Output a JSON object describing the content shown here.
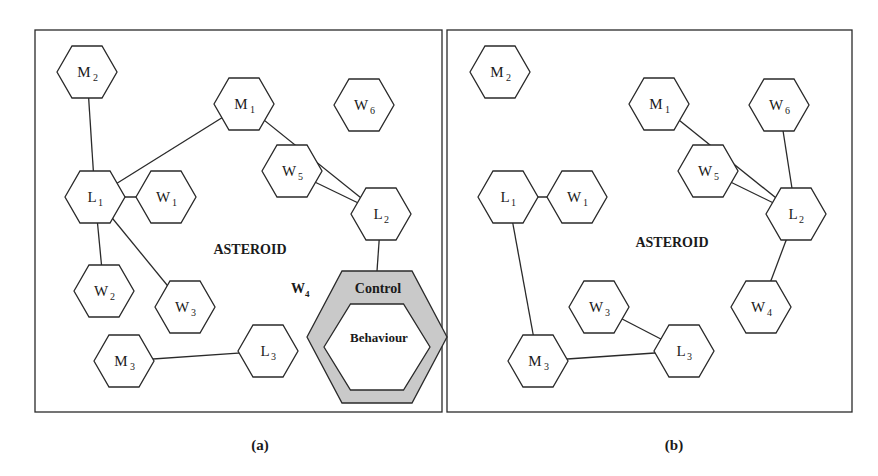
{
  "figure": {
    "panels": [
      {
        "id": "a",
        "caption": "(a)",
        "region_label": "ASTEROID",
        "frame": {
          "x": 35,
          "y": 30,
          "w": 407,
          "h": 163
        },
        "nodes": [
          {
            "id": "M2",
            "letter": "M",
            "sub": "2",
            "cx": 87,
            "cy": 72
          },
          {
            "id": "M1",
            "letter": "M",
            "sub": "1",
            "cx": 244,
            "cy": 104
          },
          {
            "id": "W6",
            "letter": "W",
            "sub": "6",
            "cx": 364,
            "cy": 105
          },
          {
            "id": "W5",
            "letter": "W",
            "sub": "5",
            "cx": 292,
            "cy": 171
          },
          {
            "id": "L1",
            "letter": "L",
            "sub": "1",
            "cx": 95,
            "cy": 197
          },
          {
            "id": "W1",
            "letter": "W",
            "sub": "1",
            "cx": 166,
            "cy": 197
          },
          {
            "id": "L2",
            "letter": "L",
            "sub": "2",
            "cx": 381,
            "cy": 214
          },
          {
            "id": "W2",
            "letter": "W",
            "sub": "2",
            "cx": 104,
            "cy": 291
          },
          {
            "id": "W3",
            "letter": "W",
            "sub": "3",
            "cx": 185,
            "cy": 307
          },
          {
            "id": "M3",
            "letter": "M",
            "sub": "3",
            "cx": 124,
            "cy": 361
          },
          {
            "id": "L3",
            "letter": "L",
            "sub": "3",
            "cx": 268,
            "cy": 351
          }
        ],
        "links": [
          [
            "M2",
            "L1"
          ],
          [
            "L1",
            "M1"
          ],
          [
            "M1",
            "L2"
          ],
          [
            "W5",
            "L2"
          ],
          [
            "L1",
            "W1"
          ],
          [
            "L1",
            "W2"
          ],
          [
            "L1",
            "W3"
          ],
          [
            "M3",
            "L3"
          ],
          [
            "L2",
            "CTRL"
          ]
        ],
        "control_node": {
          "label_w": "W",
          "label_w_sub": "4",
          "outer_label": "Control",
          "inner_label": "Behaviour",
          "fill": "#c9c9c9"
        }
      },
      {
        "id": "b",
        "caption": "(b)",
        "region_label": "ASTEROID",
        "nodes": [
          {
            "id": "M2",
            "letter": "M",
            "sub": "2",
            "cx": 500,
            "cy": 72
          },
          {
            "id": "M1",
            "letter": "M",
            "sub": "1",
            "cx": 659,
            "cy": 104
          },
          {
            "id": "W6",
            "letter": "W",
            "sub": "6",
            "cx": 779,
            "cy": 105
          },
          {
            "id": "W5",
            "letter": "W",
            "sub": "5",
            "cx": 708,
            "cy": 171
          },
          {
            "id": "L1",
            "letter": "L",
            "sub": "1",
            "cx": 508,
            "cy": 197
          },
          {
            "id": "W1",
            "letter": "W",
            "sub": "1",
            "cx": 577,
            "cy": 197
          },
          {
            "id": "L2",
            "letter": "L",
            "sub": "2",
            "cx": 796,
            "cy": 214
          },
          {
            "id": "W3",
            "letter": "W",
            "sub": "3",
            "cx": 599,
            "cy": 307
          },
          {
            "id": "W4",
            "letter": "W",
            "sub": "4",
            "cx": 761,
            "cy": 307
          },
          {
            "id": "M3",
            "letter": "M",
            "sub": "3",
            "cx": 538,
            "cy": 361
          },
          {
            "id": "L3",
            "letter": "L",
            "sub": "3",
            "cx": 684,
            "cy": 351
          }
        ],
        "links": [
          [
            "L1",
            "W1"
          ],
          [
            "L1",
            "M3"
          ],
          [
            "M1",
            "L2"
          ],
          [
            "W5",
            "L2"
          ],
          [
            "W6",
            "L2"
          ],
          [
            "L2",
            "W4"
          ],
          [
            "W3",
            "L3"
          ],
          [
            "M3",
            "L3"
          ]
        ]
      }
    ]
  }
}
